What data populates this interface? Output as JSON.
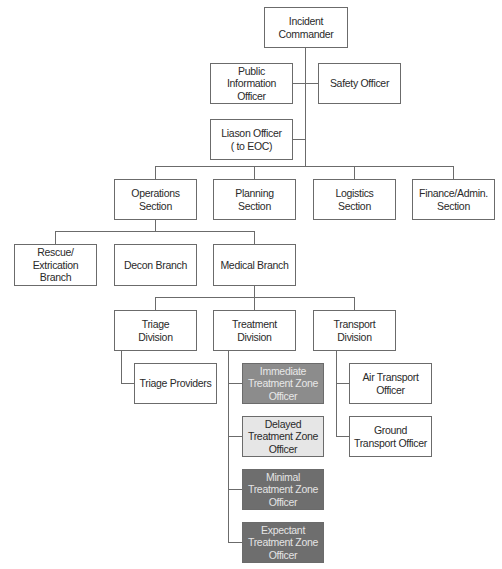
{
  "chart": {
    "title": "",
    "nodes": {
      "incident_commander": "Incident\nCommander",
      "public_information_officer": "Public\nInformation\nOfficer",
      "safety_officer": "Safety Officer",
      "liaison_officer": "Liason Officer\n( to EOC)",
      "operations_section": "Operations\nSection",
      "planning_section": "Planning\nSection",
      "logistics_section": "Logistics\nSection",
      "finance_admin_section": "Finance/Admin.\nSection",
      "rescue_extrication_branch": "Rescue/\nExtrication\nBranch",
      "decon_branch": "Decon Branch",
      "medical_branch": "Medical Branch",
      "triage_division": "Triage\nDivision",
      "treatment_division": "Treatment\nDivision",
      "transport_division": "Transport\nDivision",
      "triage_providers": "Triage Providers",
      "immediate_treatment_zone_officer": "Immediate\nTreatment Zone\nOfficer",
      "delayed_treatment_zone_officer": "Delayed\nTreatment Zone\nOfficer",
      "minimal_treatment_zone_officer": "Minimal\nTreatment Zone\nOfficer",
      "expectant_treatment_zone_officer": "Expectant\nTreatment Zone\nOfficer",
      "air_transport_officer": "Air Transport\nOfficer",
      "ground_transport_officer": "Ground\nTransport Officer"
    },
    "colors": {
      "immediate": "#8c8c8c",
      "delayed": "#e6e6e6",
      "minimal": "#6e6e6e",
      "expectant": "#6e6e6e",
      "border": "#6b6b6b"
    }
  }
}
